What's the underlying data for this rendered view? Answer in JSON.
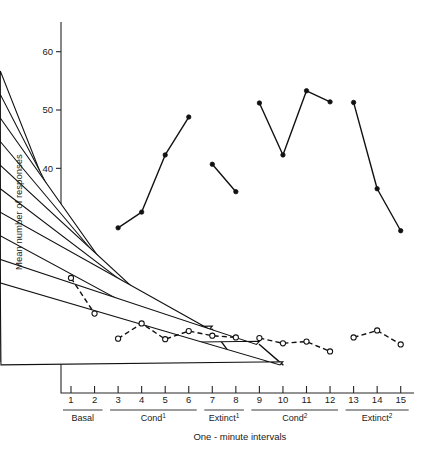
{
  "chart_data": {
    "type": "line",
    "title": "",
    "xlabel": "One - minute intervals",
    "ylabel": "Mean number of responses",
    "x": [
      1,
      2,
      3,
      4,
      5,
      6,
      7,
      8,
      9,
      10,
      11,
      12,
      13,
      14,
      15
    ],
    "xtick_labels": [
      "1",
      "2",
      "3",
      "4",
      "5",
      "6",
      "7",
      "8",
      "9",
      "10",
      "11",
      "12",
      "13",
      "14",
      "15"
    ],
    "ytick_labels": [
      "10",
      "20",
      "30",
      "40",
      "50",
      "60"
    ],
    "yticks": [
      10,
      20,
      30,
      40,
      50,
      60
    ],
    "ylim": [
      0,
      65
    ],
    "xlim": [
      0.3,
      15.7
    ],
    "grid": false,
    "legend": "none",
    "phases": [
      {
        "label": "Basal",
        "sup": "",
        "from": 1,
        "to": 2
      },
      {
        "label": "Cond",
        "sup": "1",
        "from": 3,
        "to": 6
      },
      {
        "label": "Extinct",
        "sup": "1",
        "from": 7,
        "to": 8
      },
      {
        "label": "Cond",
        "sup": "2",
        "from": 9,
        "to": 12
      },
      {
        "label": "Extinct",
        "sup": "2",
        "from": 13,
        "to": 15
      }
    ],
    "series": [
      {
        "name": "filled-circle-solid",
        "marker": "filled-circle",
        "line": "solid",
        "segments": [
          {
            "x": [
              1,
              2
            ],
            "values": [
              25.6,
              21.7
            ]
          },
          {
            "x": [
              3,
              4,
              5,
              6
            ],
            "values": [
              29.8,
              32.5,
              42.3,
              48.8
            ]
          },
          {
            "x": [
              7,
              8
            ],
            "values": [
              40.7,
              36.0
            ]
          },
          {
            "x": [
              9,
              10,
              11,
              12
            ],
            "values": [
              51.2,
              42.3,
              53.3,
              51.4
            ]
          },
          {
            "x": [
              13,
              14,
              15
            ],
            "values": [
              51.3,
              36.5,
              29.3
            ]
          }
        ]
      },
      {
        "name": "open-triangle-solid",
        "marker": "open-triangle",
        "line": "solid",
        "segments": [
          {
            "x": [
              1,
              2,
              3,
              4,
              5,
              6,
              7,
              8
            ],
            "values": [
              27.2,
              22.3,
              20.8,
              16.4,
              14.9,
              12.3,
              12.4,
              6.9
            ]
          },
          {
            "x": [
              9,
              10
            ],
            "values": [
              9.8,
              6.3
            ]
          }
        ]
      },
      {
        "name": "open-circle-dashed",
        "marker": "open-circle",
        "line": "dashed",
        "segments": [
          {
            "x": [
              1,
              2
            ],
            "values": [
              21.2,
              15.1
            ]
          },
          {
            "x": [
              3,
              4,
              5,
              6,
              7,
              8
            ],
            "values": [
              10.8,
              13.4,
              10.7,
              12.1,
              11.3,
              11.0
            ]
          },
          {
            "x": [
              9,
              10,
              11,
              12
            ],
            "values": [
              10.9,
              10.0,
              10.3,
              8.6
            ]
          },
          {
            "x": [
              13,
              14,
              15
            ],
            "values": [
              11.0,
              12.2,
              9.8
            ]
          }
        ]
      }
    ]
  }
}
